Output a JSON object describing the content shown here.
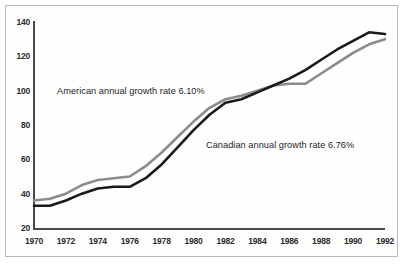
{
  "chart_data": {
    "type": "line",
    "title": "",
    "subtitle": "",
    "xlabel": "",
    "ylabel": "",
    "x": [
      1970,
      1971,
      1972,
      1973,
      1974,
      1975,
      1976,
      1977,
      1978,
      1979,
      1980,
      1981,
      1982,
      1983,
      1984,
      1985,
      1986,
      1987,
      1988,
      1989,
      1990,
      1991,
      1992
    ],
    "xlim": [
      1970,
      1992
    ],
    "ylim": [
      20,
      140
    ],
    "xticks": [
      1970,
      1972,
      1974,
      1976,
      1978,
      1980,
      1982,
      1984,
      1986,
      1988,
      1990,
      1992
    ],
    "yticks": [
      20,
      40,
      60,
      80,
      100,
      120,
      140
    ],
    "grid": false,
    "legend_position": "inline-annotations",
    "series": [
      {
        "name": "American",
        "label": "American annual growth rate 6.10%",
        "color": "#1a1a1a",
        "annual_growth_rate": "6.10%",
        "values": [
          33,
          33,
          36,
          40,
          43,
          44,
          44,
          49,
          57,
          67,
          77,
          86,
          93,
          95,
          99,
          103,
          107,
          112,
          118,
          124,
          129,
          134,
          133
        ]
      },
      {
        "name": "Canadian",
        "label": "Canadian annual growth rate 6.76%",
        "color": "#8c8c8c",
        "annual_growth_rate": "6.76%",
        "values": [
          36,
          37,
          40,
          45,
          48,
          49,
          50,
          56,
          64,
          73,
          82,
          90,
          95,
          97,
          100,
          103,
          104,
          104,
          110,
          116,
          122,
          127,
          130
        ]
      }
    ],
    "annotations": [
      {
        "text": "American annual growth rate 6.10%",
        "for": "American"
      },
      {
        "text": "Canadian annual growth rate 6.76%",
        "for": "Canadian"
      }
    ]
  },
  "axis": {
    "y_tick_labels": [
      "140",
      "120",
      "100",
      "80",
      "60",
      "40",
      "20"
    ],
    "x_tick_labels": [
      "1970",
      "1972",
      "1974",
      "1976",
      "1978",
      "1980",
      "1982",
      "1984",
      "1986",
      "1988",
      "1990",
      "1992"
    ]
  },
  "colors": {
    "american_line": "#1a1a1a",
    "canadian_line": "#8c8c8c",
    "axis": "#4a4a4a",
    "frame": "#b9b9b9",
    "background": "#ffffff",
    "text": "#2b2b2b"
  }
}
